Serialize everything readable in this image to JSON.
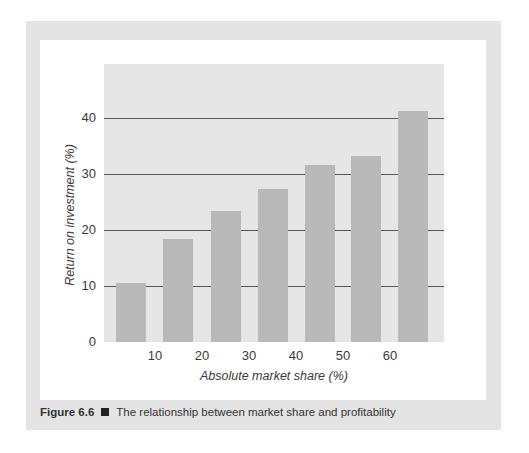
{
  "figure": {
    "label": "Figure 6.6",
    "separator_icon": "black-square",
    "caption": "The relationship between market share and profitability"
  },
  "colors": {
    "frame": "#e4e4e4",
    "plot_background": "#e6e6e6",
    "bar": "#b9b9b9",
    "gridline": "#555555"
  },
  "chart_data": {
    "type": "bar",
    "title": "The relationship between market share and profitability",
    "xlabel": "Absolute market share (%)",
    "ylabel": "Return on investment (%)",
    "categories": [
      "<10",
      "10-20",
      "20-30",
      "30-40",
      "40-50",
      "50-60",
      ">60"
    ],
    "x_tick_labels": [
      "10",
      "20",
      "30",
      "40",
      "50",
      "60"
    ],
    "y_tick_labels": [
      "0",
      "10",
      "20",
      "30",
      "40"
    ],
    "values": [
      10.5,
      18.4,
      23.4,
      27.3,
      31.6,
      33.2,
      41.3
    ],
    "ylim": [
      0,
      50
    ],
    "grid": true,
    "legend": null
  }
}
